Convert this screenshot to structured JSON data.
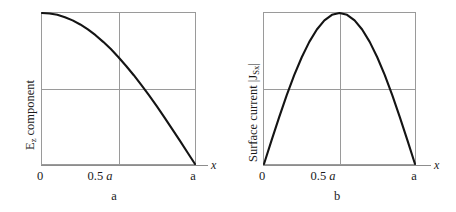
{
  "figure": {
    "background": "#ffffff",
    "curve_color": "#141414",
    "frame_color": "#9a9a9a"
  },
  "panels": [
    {
      "id": "a",
      "caption": "a",
      "ylabel_main": "E",
      "ylabel_sub": "z",
      "ylabel_rest": " component",
      "xlabel": "x",
      "ticks": {
        "zero": "0",
        "half_num": "0.5 ",
        "half_var": "a",
        "end": "a"
      }
    },
    {
      "id": "b",
      "caption": "b",
      "ylabel_pre": "Surface current |J",
      "ylabel_sub": "Sx",
      "ylabel_post": "|",
      "xlabel": "x",
      "ticks": {
        "zero": "0",
        "half_num": "0.5 ",
        "half_var": "a",
        "end": "a"
      }
    }
  ],
  "chart_data": [
    {
      "type": "line",
      "title": "a",
      "xlabel": "x",
      "ylabel": "Ez component",
      "xlim": [
        0,
        1
      ],
      "ylim": [
        0,
        1
      ],
      "xtick_values": [
        0,
        0.5,
        1
      ],
      "xtick_labels": [
        "0",
        "0.5 a",
        "a"
      ],
      "ytick_labels": [],
      "grid": "center crosshair gridlines at x = 0.5 a and y = 0.5 of full scale",
      "legend": "none",
      "x_unit": "a (waveguide broad-wall width)",
      "description": "Ez field component decays from maximum at x = 0 to zero at x = a, cosine-shaped quarter wave, flattening near x = a",
      "x": [
        0,
        0.05,
        0.1,
        0.15,
        0.2,
        0.25,
        0.3,
        0.35,
        0.4,
        0.45,
        0.5,
        0.55,
        0.6,
        0.65,
        0.7,
        0.75,
        0.8,
        0.85,
        0.9,
        0.95,
        1
      ],
      "values": [
        1.0,
        0.997,
        0.988,
        0.972,
        0.951,
        0.924,
        0.891,
        0.853,
        0.809,
        0.761,
        0.707,
        0.649,
        0.588,
        0.522,
        0.454,
        0.383,
        0.309,
        0.233,
        0.156,
        0.078,
        0.0
      ]
    },
    {
      "type": "line",
      "title": "b",
      "xlabel": "x",
      "ylabel": "Surface current |JSx|",
      "xlim": [
        0,
        1
      ],
      "ylim": [
        0,
        1
      ],
      "xtick_values": [
        0,
        0.5,
        1
      ],
      "xtick_labels": [
        "0",
        "0.5 a",
        "a"
      ],
      "ytick_labels": [],
      "grid": "center crosshair gridlines at x = 0.5 a and y = 0.5 of full scale",
      "legend": "none",
      "x_unit": "a (waveguide broad-wall width)",
      "description": "Surface current magnitude is zero at x = 0 and x = a and peaks at x = 0.5 a, half-sine shaped",
      "x": [
        0,
        0.05,
        0.1,
        0.15,
        0.2,
        0.25,
        0.3,
        0.35,
        0.4,
        0.45,
        0.5,
        0.55,
        0.6,
        0.65,
        0.7,
        0.75,
        0.8,
        0.85,
        0.9,
        0.95,
        1
      ],
      "values": [
        0.0,
        0.156,
        0.309,
        0.454,
        0.588,
        0.707,
        0.809,
        0.891,
        0.951,
        0.988,
        1.0,
        0.988,
        0.951,
        0.891,
        0.809,
        0.707,
        0.588,
        0.454,
        0.309,
        0.156,
        0.0
      ]
    }
  ]
}
